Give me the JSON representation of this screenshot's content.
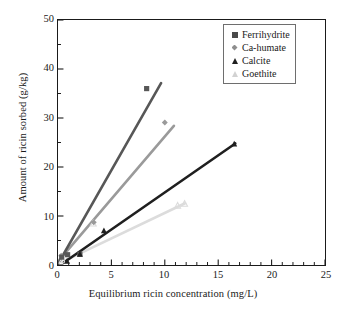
{
  "chart_data": {
    "type": "scatter",
    "title": "",
    "xlabel": "Equilibrium ricin concentration (mg/L)",
    "ylabel": "Amount of ricin sorbed (g/kg)",
    "xlim": [
      0,
      25
    ],
    "ylim": [
      0,
      50
    ],
    "xticks": [
      0,
      5,
      10,
      15,
      20,
      25
    ],
    "yticks": [
      0,
      10,
      20,
      30,
      40,
      50
    ],
    "xtick_labels": [
      "0",
      "5",
      "10",
      "15",
      "20",
      "25"
    ],
    "ytick_labels": [
      "0",
      "10",
      "20",
      "30",
      "40",
      "50"
    ],
    "x_minor_step": 1,
    "y_minor_step": 5,
    "grid": false,
    "legend_position": "top-right",
    "series": [
      {
        "name": "Ferrihydrite",
        "color": "#575757",
        "marker": "square",
        "points": [
          [
            0.35,
            1.6
          ],
          [
            0.9,
            2.1
          ],
          [
            2.05,
            2.2
          ],
          [
            8.3,
            36.0
          ]
        ],
        "fit_line": [
          [
            0.1,
            0.6
          ],
          [
            9.65,
            37.1
          ]
        ]
      },
      {
        "name": "Ca-humate",
        "color": "#9a9a9a",
        "marker": "diamond",
        "points": [
          [
            0.3,
            1.9
          ],
          [
            3.35,
            8.7
          ],
          [
            10.0,
            29.1
          ]
        ],
        "fit_line": [
          [
            0.15,
            1.1
          ],
          [
            10.85,
            28.4
          ]
        ]
      },
      {
        "name": "Calcite",
        "color": "#1f1f1f",
        "marker": "triangle",
        "points": [
          [
            0.85,
            0.8
          ],
          [
            2.05,
            2.2
          ],
          [
            4.3,
            7.0
          ],
          [
            16.5,
            24.7
          ]
        ],
        "fit_line": [
          [
            0.55,
            0.5
          ],
          [
            16.6,
            24.8
          ]
        ]
      },
      {
        "name": "Goethite",
        "color": "#dcdcdc",
        "marker": "triangle-open",
        "points": [
          [
            0.4,
            1.0
          ],
          [
            3.3,
            8.5
          ],
          [
            11.2,
            12.1
          ],
          [
            11.85,
            12.5
          ]
        ],
        "fit_line": [
          [
            0.35,
            0.6
          ],
          [
            11.9,
            12.6
          ]
        ]
      }
    ]
  },
  "legend": {
    "items": [
      {
        "label": "Ferrihydrite",
        "marker": "square-filled-icon"
      },
      {
        "label": "Ca-humate",
        "marker": "diamond-filled-icon"
      },
      {
        "label": "Calcite",
        "marker": "triangle-filled-icon"
      },
      {
        "label": "Goethite",
        "marker": "triangle-open-icon"
      }
    ]
  }
}
